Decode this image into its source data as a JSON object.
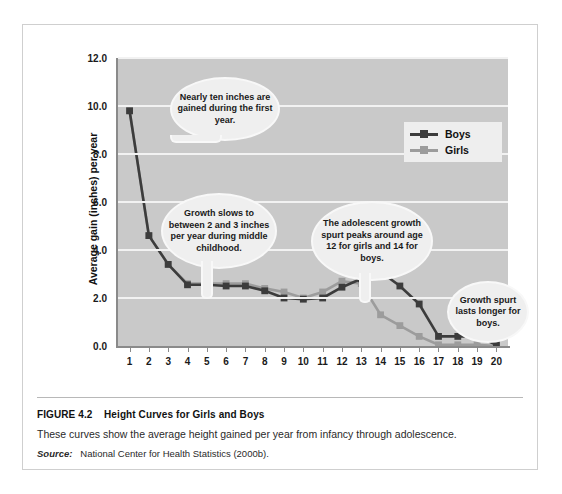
{
  "figure": {
    "number": "FIGURE 4.2",
    "title": "Height Curves for Girls and Boys",
    "description": "These curves show the average height gained per year from infancy through adolescence.",
    "source_label": "Source:",
    "source_text": "National Center for Health Statistics (2000b)."
  },
  "legend": {
    "items": [
      {
        "label": "Boys",
        "color": "#3c3c3c"
      },
      {
        "label": "Girls",
        "color": "#9c9c9c"
      }
    ]
  },
  "callouts": [
    {
      "id": "callout-first-year",
      "text": "Nearly ten inches are gained during the first year."
    },
    {
      "id": "callout-middle-childhood",
      "text": "Growth slows to between 2 and 3 inches per year during middle childhood."
    },
    {
      "id": "callout-adolescent-spurt",
      "text": "The adolescent growth spurt peaks around age 12 for girls and 14 for boys."
    },
    {
      "id": "callout-boys-longer",
      "text": "Growth spurt lasts longer for boys."
    }
  ],
  "colors": {
    "plot_background": "#c9c9c9",
    "gridline": "#f2f2f2",
    "axis": "#8a8a8a",
    "boys": "#3c3c3c",
    "girls": "#9c9c9c",
    "page_background": "#ffffff",
    "callout_fill": "#efefef"
  },
  "chart_data": {
    "type": "line",
    "title": "Height Curves for Girls and Boys",
    "xlabel": "",
    "ylabel": "Average gain (inches) per year",
    "x": [
      1,
      2,
      3,
      4,
      5,
      6,
      7,
      8,
      9,
      10,
      11,
      12,
      13,
      14,
      15,
      16,
      17,
      18,
      19,
      20
    ],
    "xticklabels": [
      "1",
      "2",
      "3",
      "4",
      "5",
      "6",
      "7",
      "8",
      "9",
      "10",
      "11",
      "12",
      "13",
      "14",
      "15",
      "16",
      "17",
      "18",
      "19",
      "20"
    ],
    "yticklabels": [
      "0.0",
      "2.0",
      "4.0",
      "6.0",
      "8.0",
      "10.0",
      "12.0"
    ],
    "yticks": [
      0.0,
      2.0,
      4.0,
      6.0,
      8.0,
      10.0,
      12.0
    ],
    "xlim": [
      0.4,
      20.6
    ],
    "ylim": [
      0.0,
      12.0
    ],
    "grid": "horizontal",
    "legend_position": "upper-right",
    "series": [
      {
        "name": "Boys",
        "color": "#3c3c3c",
        "values": [
          9.8,
          4.6,
          3.4,
          2.55,
          2.55,
          2.5,
          2.5,
          2.3,
          2.0,
          1.95,
          2.0,
          2.45,
          2.8,
          3.1,
          2.5,
          1.75,
          0.4,
          0.4,
          0.4,
          0.05
        ]
      },
      {
        "name": "Girls",
        "color": "#9c9c9c",
        "values": [
          9.8,
          4.6,
          3.4,
          2.6,
          2.6,
          2.6,
          2.6,
          2.4,
          2.25,
          2.0,
          2.25,
          2.7,
          2.6,
          1.3,
          0.85,
          0.4,
          0.05,
          0.05,
          0.05,
          0.0
        ]
      }
    ],
    "annotations": [
      "Nearly ten inches are gained during the first year.",
      "Growth slows to between 2 and 3 inches per year during middle childhood.",
      "The adolescent growth spurt peaks around age 12 for girls and 14 for boys.",
      "Growth spurt lasts longer for boys."
    ]
  }
}
